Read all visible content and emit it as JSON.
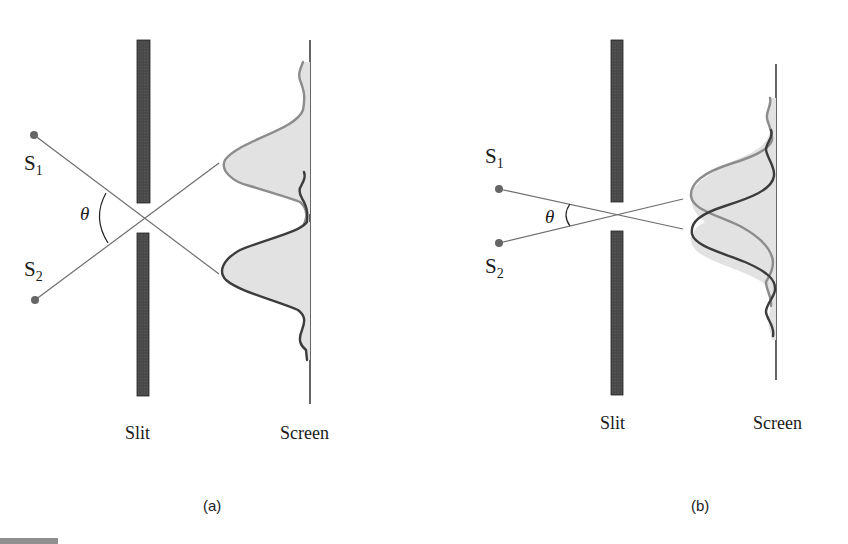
{
  "figure": {
    "panels": [
      {
        "id": "a",
        "caption": "(a)",
        "source1": {
          "label": "S",
          "sub": "1"
        },
        "source2": {
          "label": "S",
          "sub": "2"
        },
        "angle_label": "θ",
        "slit_label": "Slit",
        "screen_label": "Screen",
        "description": "Sources well separated: diffraction patterns on screen are resolved"
      },
      {
        "id": "b",
        "caption": "(b)",
        "source1": {
          "label": "S",
          "sub": "1"
        },
        "source2": {
          "label": "S",
          "sub": "2"
        },
        "angle_label": "θ",
        "slit_label": "Slit",
        "screen_label": "Screen",
        "description": "Sources close together: diffraction patterns overlap and are not resolved"
      }
    ],
    "colors": {
      "slit": "#4a4a4a",
      "light_curve": "#8c8c8c",
      "dark_curve": "#3c3c3c",
      "fill": "#e2e2e2",
      "ray": "#6e6e6e",
      "screen": "#111111"
    }
  }
}
